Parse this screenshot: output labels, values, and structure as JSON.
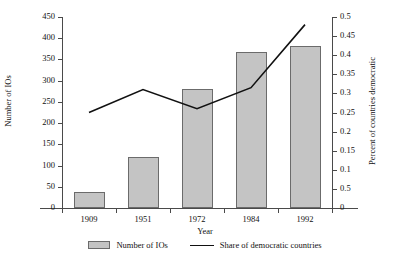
{
  "chart_data": {
    "type": "bar",
    "title": "",
    "xlabel": "Year",
    "categories": [
      "1909",
      "1951",
      "1972",
      "1984",
      "1992"
    ],
    "grid": false,
    "legend_position": "bottom",
    "axes": {
      "left": {
        "label": "Number of IOs",
        "ylim": [
          0,
          450
        ],
        "tick_step": 50,
        "ticks": [
          "0",
          "50",
          "100",
          "150",
          "200",
          "250",
          "300",
          "350",
          "400",
          "450"
        ],
        "tick_values": [
          0,
          50,
          100,
          150,
          200,
          250,
          300,
          350,
          400,
          450
        ]
      },
      "right": {
        "label": "Percent of countries democratic",
        "ylim": [
          0,
          0.5
        ],
        "tick_step": 0.05,
        "ticks": [
          "0",
          "0.5",
          "0.1",
          "0.15",
          "0.2",
          "0.25",
          "0.3",
          "0.35",
          "0.4",
          "0.45",
          "0.5"
        ],
        "tick_values": [
          0,
          0.05,
          0.1,
          0.15,
          0.2,
          0.25,
          0.3,
          0.35,
          0.4,
          0.45,
          0.5
        ]
      }
    },
    "series": [
      {
        "name": "Number of IOs",
        "kind": "bar",
        "axis": "left",
        "color": "#c4c4c4",
        "edge_color": "#6b6b6b",
        "values": [
          38,
          120,
          280,
          368,
          382
        ]
      },
      {
        "name": "Share of democratic countries",
        "kind": "line",
        "axis": "right",
        "color": "#111111",
        "values": [
          0.25,
          0.31,
          0.26,
          0.315,
          0.48
        ]
      }
    ]
  },
  "legend": {
    "items": [
      {
        "label": "Number of IOs",
        "marker": "bar-swatch"
      },
      {
        "label": "Share of democratic countries",
        "marker": "line-swatch"
      }
    ]
  }
}
